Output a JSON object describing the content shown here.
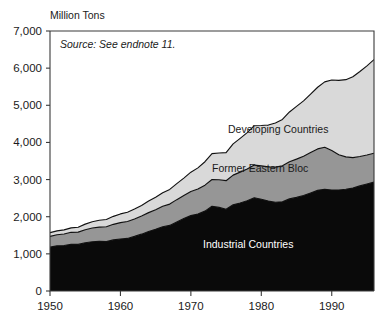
{
  "chart_data": {
    "type": "area",
    "title": "",
    "subtitle": "",
    "ylabel": "Million Tons",
    "xlabel": "",
    "annotation": "Source: See endnote 11.",
    "stacked": true,
    "grid": false,
    "legend_position": "inline-labels",
    "xlim": [
      1950,
      1996
    ],
    "ylim": [
      0,
      7000
    ],
    "y_ticks": [
      0,
      1000,
      2000,
      3000,
      4000,
      5000,
      6000,
      7000
    ],
    "y_tick_labels": [
      "0",
      "1,000",
      "2,000",
      "3,000",
      "4,000",
      "5,000",
      "6,000",
      "7,000"
    ],
    "x_ticks": [
      1950,
      1960,
      1970,
      1980,
      1990
    ],
    "x_tick_labels": [
      "1950",
      "1960",
      "1970",
      "1980",
      "1990"
    ],
    "x": [
      1950,
      1951,
      1952,
      1953,
      1954,
      1955,
      1956,
      1957,
      1958,
      1959,
      1960,
      1961,
      1962,
      1963,
      1964,
      1965,
      1966,
      1967,
      1968,
      1969,
      1970,
      1971,
      1972,
      1973,
      1974,
      1975,
      1976,
      1977,
      1978,
      1979,
      1980,
      1981,
      1982,
      1983,
      1984,
      1985,
      1986,
      1987,
      1988,
      1989,
      1990,
      1991,
      1992,
      1993,
      1994,
      1995,
      1996
    ],
    "series": [
      {
        "name": "Industrial Countries",
        "color": "#0a0a0a",
        "label_color": "#ffffff",
        "values": [
          1180,
          1215,
          1225,
          1260,
          1255,
          1300,
          1325,
          1340,
          1330,
          1375,
          1400,
          1415,
          1470,
          1530,
          1600,
          1660,
          1730,
          1765,
          1860,
          1950,
          2030,
          2070,
          2150,
          2280,
          2250,
          2200,
          2320,
          2370,
          2430,
          2510,
          2470,
          2420,
          2390,
          2400,
          2480,
          2520,
          2570,
          2640,
          2710,
          2740,
          2720,
          2720,
          2740,
          2770,
          2830,
          2880,
          2930
        ]
      },
      {
        "name": "Former Eastern Bloc",
        "color": "#969696",
        "label_color": "#1a1a1a",
        "values": [
          290,
          300,
          310,
          320,
          330,
          350,
          370,
          380,
          400,
          420,
          440,
          455,
          470,
          490,
          510,
          530,
          550,
          575,
          600,
          620,
          650,
          675,
          700,
          720,
          745,
          770,
          800,
          830,
          855,
          880,
          900,
          920,
          945,
          970,
          1000,
          1030,
          1060,
          1090,
          1115,
          1130,
          1060,
          950,
          870,
          820,
          790,
          780,
          780
        ]
      },
      {
        "name": "Developing Countries",
        "color": "#d9d9d9",
        "label_color": "#1a1a1a",
        "values": [
          100,
          105,
          110,
          120,
          130,
          150,
          170,
          185,
          195,
          215,
          235,
          250,
          265,
          285,
          310,
          335,
          365,
          395,
          430,
          470,
          520,
          570,
          630,
          700,
          720,
          755,
          840,
          910,
          980,
          1060,
          1085,
          1130,
          1190,
          1250,
          1340,
          1420,
          1490,
          1570,
          1660,
          1760,
          1900,
          2000,
          2080,
          2180,
          2290,
          2400,
          2520
        ]
      }
    ],
    "totals": [
      1570,
      1620,
      1645,
      1700,
      1715,
      1800,
      1865,
      1905,
      1925,
      2010,
      2075,
      2120,
      2205,
      2305,
      2420,
      2525,
      2645,
      2735,
      2890,
      3040,
      3200,
      3315,
      3480,
      3700,
      3715,
      3725,
      3960,
      4110,
      4265,
      4450,
      4455,
      4470,
      4525,
      4620,
      4820,
      4970,
      5120,
      5300,
      5485,
      5630,
      5680,
      5670,
      5690,
      5770,
      5910,
      6060,
      6230
    ]
  },
  "labels": {
    "developing": "Developing Countries",
    "eastern_bloc": "Former Eastern Bloc",
    "industrial": "Industrial Countries"
  },
  "colors": {
    "developing": "#d9d9d9",
    "eastern_bloc": "#969696",
    "industrial": "#0a0a0a",
    "outline": "#111111",
    "frame": "#3a3a3a",
    "text": "#1a1a1a",
    "background": "#ffffff"
  }
}
